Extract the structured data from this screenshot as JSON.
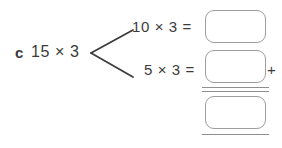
{
  "worksheet": {
    "item_letter": "c",
    "root_expression": "15 × 3",
    "branches": [
      {
        "expression": "10 × 3 =",
        "answer_value": "",
        "answer_placeholder": ""
      },
      {
        "expression": "5 × 3 =",
        "answer_value": "",
        "answer_placeholder": ""
      }
    ],
    "operator": "+",
    "total": {
      "answer_value": "",
      "answer_placeholder": ""
    }
  },
  "colors": {
    "text": "#3b3b3b",
    "box_border": "#9d9d9d",
    "rule": "#8f8f8f",
    "branch_line": "#3b3b3b",
    "background": "#ffffff"
  }
}
